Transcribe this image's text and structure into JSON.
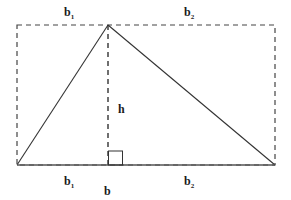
{
  "diagram": {
    "type": "geometry-triangle-area",
    "colors": {
      "stroke": "#333333",
      "dashed": "#444444",
      "background": "#ffffff",
      "text": "#1a1a1a"
    },
    "labels": {
      "top_left": {
        "base": "b",
        "sub": "1"
      },
      "top_right": {
        "base": "b",
        "sub": "2"
      },
      "height": "h",
      "bottom_left": {
        "base": "b",
        "sub": "1"
      },
      "bottom_right": {
        "base": "b",
        "sub": "2"
      },
      "base": "b"
    }
  }
}
